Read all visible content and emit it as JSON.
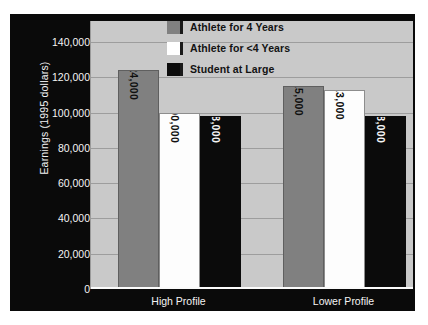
{
  "chart_data": {
    "type": "bar",
    "title": "",
    "xlabel": "",
    "ylabel": "Earnings (1995 dollars)",
    "categories": [
      "High Profile",
      "Lower Profile"
    ],
    "series": [
      {
        "name": "Athlete for 4 Years",
        "values": [
          124000,
          115000
        ],
        "labels": [
          "$124,000",
          "$115,000"
        ],
        "color": "#808080"
      },
      {
        "name": "Athlete for <4 Years",
        "values": [
          100000,
          113000
        ],
        "labels": [
          "$100,000",
          "$113,000"
        ],
        "color": "#ffffff"
      },
      {
        "name": "Student at Large",
        "values": [
          98000,
          98000
        ],
        "labels": [
          "$98,000",
          "$98,000"
        ],
        "color": "#0b0b0b"
      }
    ],
    "ylim": [
      0,
      140000
    ],
    "ytick_values": [
      140000,
      120000,
      100000,
      80000,
      60000,
      40000,
      20000,
      0
    ],
    "ytick_labels": [
      "140,000",
      "120,000",
      "100,000",
      "80,000",
      "60,000",
      "40,000",
      "20,000",
      "0"
    ],
    "grid": true,
    "legend_position": "top-center",
    "plot_background": "#c9c9c9",
    "frame_background": "#0a0a0a"
  }
}
